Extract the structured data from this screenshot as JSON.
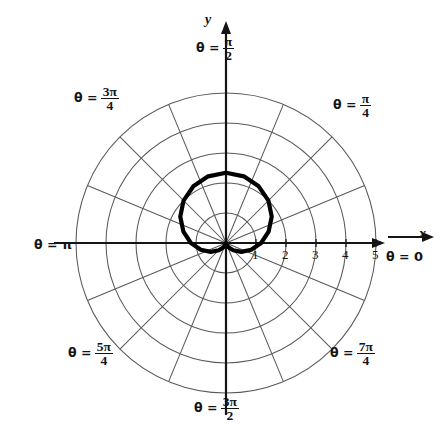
{
  "figure": {
    "type": "polar-plot",
    "background": "#ffffff",
    "ink": "#141414",
    "grid_color": "#5a5a5a",
    "curve_color": "#000000"
  },
  "axes": {
    "x_label": "x",
    "y_label": "y",
    "origin_px": [
      226,
      243
    ],
    "pixels_per_unit": 30,
    "x_ticks": [
      "1",
      "2",
      "3",
      "4",
      "5"
    ],
    "x_tick_values": [
      1,
      2,
      3,
      4,
      5
    ]
  },
  "angle_labels": [
    {
      "name": "theta-zero",
      "theta": "θ =",
      "value": "0",
      "kind": "plain",
      "deg": 0
    },
    {
      "name": "theta-pi-over-4",
      "theta": "θ =",
      "num": "π",
      "den": "4",
      "kind": "frac",
      "deg": 45
    },
    {
      "name": "theta-pi-over-2",
      "theta": "θ =",
      "num": "π",
      "den": "2",
      "kind": "frac",
      "deg": 90
    },
    {
      "name": "theta-3pi-over-4",
      "theta": "θ =",
      "num": "3π",
      "den": "4",
      "kind": "frac",
      "deg": 135
    },
    {
      "name": "theta-pi",
      "theta": "θ =",
      "value": "π",
      "kind": "plain",
      "deg": 180
    },
    {
      "name": "theta-5pi-over-4",
      "theta": "θ =",
      "num": "5π",
      "den": "4",
      "kind": "frac",
      "deg": 225
    },
    {
      "name": "theta-3pi-over-2",
      "theta": "θ =",
      "num": "3π",
      "den": "2",
      "kind": "frac",
      "deg": 270
    },
    {
      "name": "theta-7pi-over-4",
      "theta": "θ =",
      "num": "7π",
      "den": "4",
      "kind": "frac",
      "deg": 315
    }
  ],
  "chart_data": {
    "type": "line",
    "coordinate_system": "polar",
    "title": "",
    "xlabel": "x",
    "ylabel": "y",
    "rlim": [
      0,
      5
    ],
    "r_ticks": [
      1,
      2,
      3,
      4,
      5
    ],
    "theta_tick_labels": [
      "θ = 0",
      "θ = π/4",
      "θ = π/2",
      "θ = 3π/4",
      "θ = π",
      "θ = 5π/4",
      "θ = 3π/2",
      "θ = 7π/4"
    ],
    "grid": true,
    "legend": "none",
    "radial_gridlines_count": 16,
    "radial_gridline_step": "π/8",
    "series": [
      {
        "name": "cardioid",
        "equation": "r = 1.17 (1 + sin θ)",
        "a": 1.17,
        "r_max": 2.34,
        "r_max_at_theta": "π/2",
        "r_min": 0,
        "r_min_at_theta": "3π/2",
        "theta_deg": [
          0,
          15,
          30,
          45,
          60,
          75,
          90,
          105,
          120,
          135,
          150,
          165,
          180,
          195,
          210,
          225,
          240,
          255,
          270,
          285,
          300,
          315,
          330,
          345,
          360
        ],
        "r": [
          1.17,
          1.47,
          1.76,
          2.0,
          2.18,
          2.3,
          2.34,
          2.3,
          2.18,
          2.0,
          1.76,
          1.47,
          1.17,
          0.87,
          0.59,
          0.34,
          0.16,
          0.04,
          0.0,
          0.04,
          0.16,
          0.34,
          0.59,
          0.87,
          1.17
        ]
      }
    ]
  }
}
